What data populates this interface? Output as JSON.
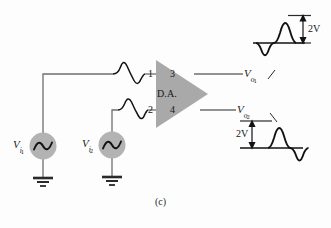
{
  "figure": {
    "caption": "(c)",
    "amplifier": {
      "label": "D.A.",
      "pins": {
        "in_top": "1",
        "in_bottom": "2",
        "out_top": "3",
        "out_bottom": "4"
      },
      "fill_color": "#a9a9a9"
    },
    "sources": [
      {
        "name": "source-vi1",
        "symbol": "V",
        "subscript": "i",
        "subsubscript": "1",
        "fill_color": "#b3b3b3"
      },
      {
        "name": "source-vi2",
        "symbol": "V",
        "subscript": "i",
        "subsubscript": "2",
        "fill_color": "#b3b3b3"
      }
    ],
    "outputs": [
      {
        "name": "output-vo1",
        "symbol": "V",
        "subscript": "o",
        "subsubscript": "1",
        "amplitude_label": "2V",
        "amplitude_value": 2,
        "amplitude_unit": "V",
        "phase": "in-phase"
      },
      {
        "name": "output-vo2",
        "symbol": "V",
        "subscript": "o",
        "subsubscript": "2",
        "amplitude_label": "2V",
        "amplitude_value": 2,
        "amplitude_unit": "V",
        "phase": "inverted"
      }
    ],
    "ground_symbol": "earth-ground",
    "colors": {
      "wire": "#6e6e6e",
      "waveform": "#121212",
      "text": "#151515",
      "background": "#fdfdfd"
    }
  }
}
